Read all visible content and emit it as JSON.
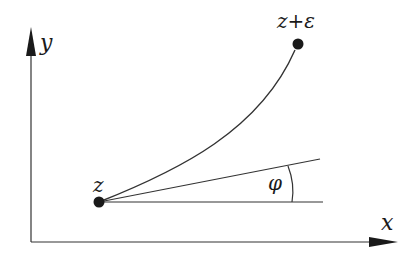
{
  "diagram": {
    "axes": {
      "x_label": "x",
      "y_label": "y"
    },
    "points": [
      {
        "id": "z",
        "label": "z"
      },
      {
        "id": "z_plus_eps",
        "label": "z+ε"
      }
    ],
    "angle": {
      "label": "φ"
    },
    "colors": {
      "stroke": "#2a2a2a",
      "background": "#ffffff"
    }
  }
}
